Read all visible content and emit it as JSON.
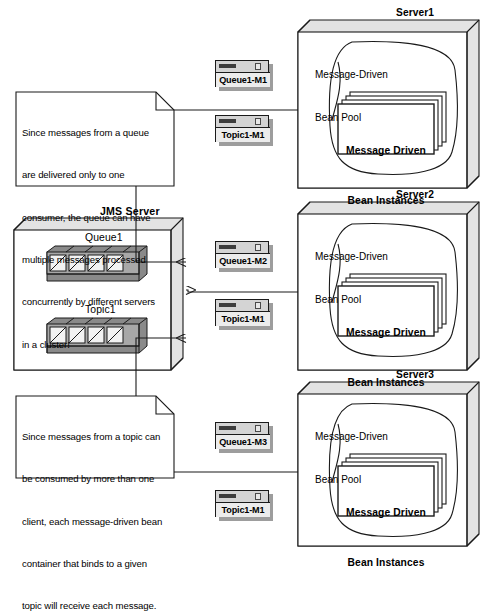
{
  "diagram": {
    "notes": [
      {
        "id": "queue-note",
        "lines": [
          "Since messages from a queue",
          "are delivered only to one",
          "consumer, the queue can have",
          "multiple messages processed",
          "concurrently by different servers",
          "in a cluster!"
        ]
      },
      {
        "id": "topic-note",
        "lines": [
          "Since messages from a topic can",
          "be consumed by more than one",
          "client, each message-driven bean",
          "container that binds to a given",
          "topic will receive each message."
        ]
      }
    ],
    "jms_server": {
      "label": "JMS Server",
      "destinations": [
        {
          "label": "Queue1",
          "message_count": 4
        },
        {
          "label": "Topic1",
          "message_count": 4
        }
      ]
    },
    "messages": [
      {
        "label": "Queue1-M1"
      },
      {
        "label": "Topic1-M1"
      },
      {
        "label": "Queue1-M2"
      },
      {
        "label": "Topic1-M1"
      },
      {
        "label": "Queue1-M3"
      },
      {
        "label": "Topic1-M1"
      }
    ],
    "servers": [
      {
        "name": "Server1",
        "pool_label_lines": [
          "Message-Driven",
          "Bean Pool"
        ],
        "instances_lines": [
          "Message Driven",
          "Bean Instances"
        ]
      },
      {
        "name": "Server2",
        "pool_label_lines": [
          "Message-Driven",
          "Bean Pool"
        ],
        "instances_lines": [
          "Message Driven",
          "Bean Instances"
        ]
      },
      {
        "name": "Server3",
        "pool_label_lines": [
          "Message-Driven",
          "Bean Pool"
        ],
        "instances_lines": [
          "Message Driven",
          "Bean Instances"
        ]
      }
    ],
    "colors": {
      "stroke": "#1a1a1a",
      "page": "#ffffff",
      "box_face": "#ffffff",
      "box_side": "#e3e3e3",
      "cube_face": "#a8a8a8",
      "cube_side": "#8a8a8a",
      "icon_body": "#d4d4d4",
      "icon_shadow": "#9d9d9d"
    }
  }
}
